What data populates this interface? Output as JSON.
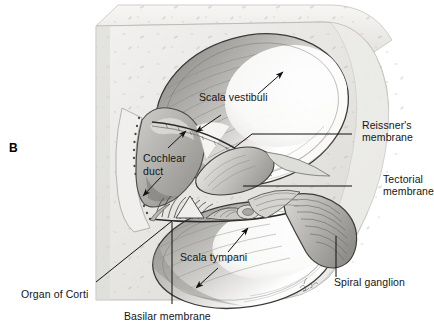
{
  "figure": {
    "panel_letter": "B",
    "signature": "Beck",
    "style": "grayscale anatomical illustration",
    "background_color": "#ffffff",
    "ink_color": "#151515",
    "bone_color": "#e8e7e4"
  },
  "labels": {
    "scala_vestibuli": "Scala vestibuli",
    "reissners_membrane_line1": "Reissner's",
    "reissners_membrane_line2": "membrane",
    "tectorial_membrane_line1": "Tectorial",
    "tectorial_membrane_line2": "membrane",
    "cochlear_duct_line1": "Cochlear",
    "cochlear_duct_line2": "duct",
    "scala_tympani": "Scala tympani",
    "spiral_ganglion": "Spiral ganglion",
    "organ_of_corti": "Organ of Corti",
    "basilar_membrane": "Basilar membrane"
  }
}
